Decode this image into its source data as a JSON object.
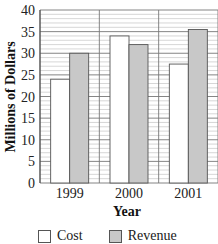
{
  "chart_data": {
    "type": "bar",
    "title": "",
    "xlabel": "Year",
    "ylabel": "Millions of Dollars",
    "categories": [
      "1999",
      "2000",
      "2001"
    ],
    "series": [
      {
        "name": "Cost",
        "values": [
          24,
          34,
          27.5
        ],
        "color": "#ffffff"
      },
      {
        "name": "Revenue",
        "values": [
          30,
          32,
          35.5
        ],
        "color": "#c8c8c8"
      }
    ],
    "ylim": [
      0,
      40
    ],
    "yticks": [
      0,
      5,
      10,
      15,
      20,
      25,
      30,
      35,
      40
    ],
    "grid": {
      "major_step": 5,
      "minor_step": 1,
      "horizontal": true
    },
    "legend_position": "bottom"
  },
  "legend": {
    "items": [
      {
        "label": "Cost",
        "color": "#ffffff"
      },
      {
        "label": "Revenue",
        "color": "#c8c8c8"
      }
    ]
  }
}
